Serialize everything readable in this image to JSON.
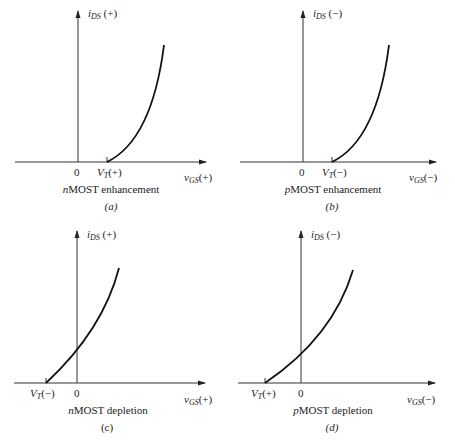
{
  "panels": [
    {
      "id": "a",
      "ylabel_var": "i",
      "ylabel_sub": "DS",
      "ylabel_sign": "(+)",
      "xlabel_var": "v",
      "xlabel_sub": "GS",
      "xlabel_sign": "(+)",
      "zero": "0",
      "vt_var": "V",
      "vt_sub": "T",
      "vt_sign": "(+)",
      "caption_prefix": "n",
      "caption_rest": "MOST enhancement",
      "fig_label": "(a)"
    },
    {
      "id": "b",
      "ylabel_var": "i",
      "ylabel_sub": "DS",
      "ylabel_sign": "(−)",
      "xlabel_var": "v",
      "xlabel_sub": "GS",
      "xlabel_sign": "(−)",
      "zero": "0",
      "vt_var": "V",
      "vt_sub": "T",
      "vt_sign": "(−)",
      "caption_prefix": "p",
      "caption_rest": "MOST enhancement",
      "fig_label": "(b)"
    },
    {
      "id": "c",
      "ylabel_var": "i",
      "ylabel_sub": "DS",
      "ylabel_sign": "(+)",
      "xlabel_var": "v",
      "xlabel_sub": "GS",
      "xlabel_sign": "(+)",
      "zero": "0",
      "vt_var": "V",
      "vt_sub": "T",
      "vt_sign": "(−)",
      "caption_prefix": "n",
      "caption_rest": "MOST depletion",
      "fig_label": "(c)"
    },
    {
      "id": "d",
      "ylabel_var": "i",
      "ylabel_sub": "DS",
      "ylabel_sign": "(−)",
      "xlabel_var": "v",
      "xlabel_sub": "GS",
      "xlabel_sign": "(−)",
      "zero": "0",
      "vt_var": "V",
      "vt_sub": "T",
      "vt_sign": "(+)",
      "caption_prefix": "p",
      "caption_rest": "MOST depletion",
      "fig_label": "(d)"
    }
  ],
  "colors": {
    "ink": "#222222",
    "axis": "#333333",
    "background": "#ffffff"
  }
}
